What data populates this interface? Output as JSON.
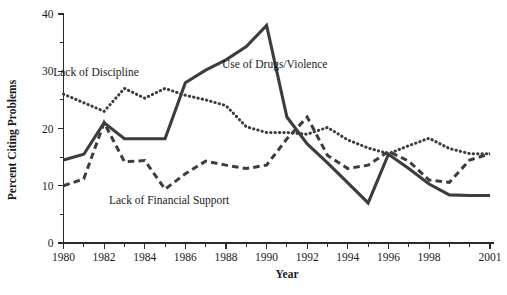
{
  "chart_data": {
    "type": "line",
    "title": "",
    "xlabel": "Year",
    "ylabel": "Percent Citing Problems",
    "xlim": [
      1980,
      2001
    ],
    "ylim": [
      0,
      40
    ],
    "grid": false,
    "legend_position": "inline-annotations",
    "x": [
      1980,
      1981,
      1982,
      1983,
      1984,
      1985,
      1986,
      1987,
      1988,
      1989,
      1990,
      1991,
      1992,
      1993,
      1994,
      1995,
      1996,
      1997,
      1998,
      1999,
      2000,
      2001
    ],
    "xtick_labels": [
      "1980",
      "1982",
      "1984",
      "1986",
      "1988",
      "1990",
      "1992",
      "1994",
      "1996",
      "1998",
      "2001"
    ],
    "xtick_values": [
      1980,
      1982,
      1984,
      1986,
      1988,
      1990,
      1992,
      1994,
      1996,
      1998,
      2001
    ],
    "ytick_labels": [
      "0",
      "10",
      "20",
      "30",
      "40"
    ],
    "ytick_values": [
      0,
      10,
      20,
      30,
      40
    ],
    "ytick_minor_values": [
      5,
      15,
      25,
      35
    ],
    "series": [
      {
        "name": "Use of Drugs/Violence",
        "style": "solid",
        "color": "#3d3d3d",
        "label_x": 1990.4,
        "label_y": 30.5,
        "values": [
          14.5,
          15.5,
          21.0,
          18.2,
          18.2,
          18.2,
          28.0,
          30.2,
          32.0,
          34.3,
          38.0,
          22.0,
          17.3,
          14.0,
          10.5,
          7.0,
          15.5,
          13.0,
          10.3,
          8.4,
          8.3,
          8.3
        ]
      },
      {
        "name": "Lack of Discipline",
        "style": "dotted",
        "color": "#3d3d3d",
        "label_x": 1981.6,
        "label_y": 29.2,
        "values": [
          26.0,
          24.5,
          23.0,
          27.0,
          25.3,
          27.0,
          25.8,
          25.0,
          24.0,
          20.3,
          19.3,
          19.3,
          19.0,
          20.2,
          18.0,
          16.6,
          15.6,
          17.0,
          18.3,
          16.5,
          15.6,
          15.6
        ]
      },
      {
        "name": "Lack of Financial Support",
        "style": "dashed",
        "color": "#3d3d3d",
        "label_x": 1985.2,
        "label_y": 6.9,
        "values": [
          10.0,
          11.2,
          21.0,
          14.2,
          14.4,
          9.4,
          12.1,
          14.3,
          13.6,
          13.0,
          13.6,
          18.2,
          22.0,
          15.3,
          13.0,
          13.6,
          16.0,
          14.3,
          11.0,
          10.6,
          14.5,
          15.6
        ]
      }
    ]
  }
}
